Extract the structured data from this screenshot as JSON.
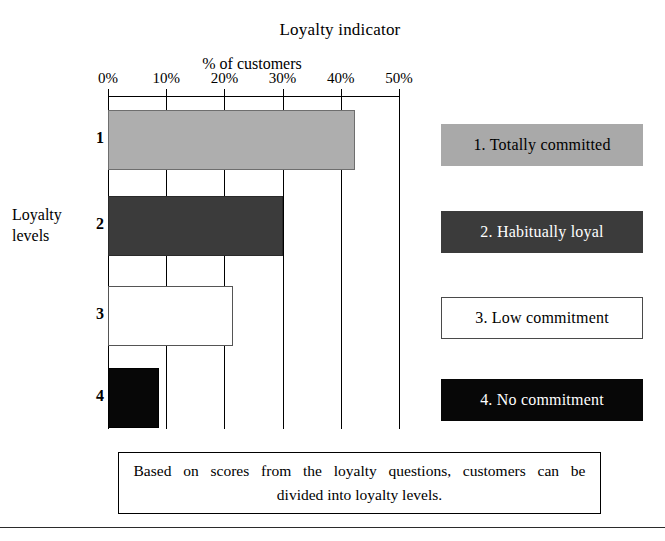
{
  "chart_data": {
    "type": "bar",
    "orientation": "horizontal",
    "title": "Loyalty indicator",
    "xlabel": "% of customers",
    "ylabel": "Loyalty levels",
    "categories": [
      "1",
      "2",
      "3",
      "4"
    ],
    "values": [
      42.5,
      30.0,
      21.5,
      8.8
    ],
    "xlim": [
      0,
      50
    ],
    "xticks": [
      0,
      10,
      20,
      30,
      40,
      50
    ],
    "xtick_labels": [
      "0%",
      "10%",
      "20%",
      "30%",
      "40%",
      "50%"
    ],
    "grid": true,
    "axis_position": "top",
    "legend_position": "right",
    "series": [
      {
        "name": "Totally committed",
        "category": "1",
        "value": 42.5,
        "fill": "#aeaeae",
        "text_color": "#000000"
      },
      {
        "name": "Habitually loyal",
        "category": "2",
        "value": 30.0,
        "fill": "#3b3b3b",
        "text_color": "#ffffff"
      },
      {
        "name": "Low commitment",
        "category": "3",
        "value": 21.5,
        "fill": "#ffffff",
        "text_color": "#000000"
      },
      {
        "name": "No commitment",
        "category": "4",
        "value": 8.8,
        "fill": "#070707",
        "text_color": "#ffffff"
      }
    ],
    "annotations": [
      "Based on scores from the loyalty questions, customers can be",
      "divided into loyalty levels."
    ]
  },
  "chart": {
    "title": "Loyalty indicator",
    "axis_title": "% of customers",
    "y_axis_label_line1": "Loyalty",
    "y_axis_label_line2": "levels",
    "tick_labels": [
      "0%",
      "10%",
      "20%",
      "30%",
      "40%",
      "50%"
    ],
    "category_labels": [
      "1",
      "2",
      "3",
      "4"
    ]
  },
  "legend": {
    "items": [
      {
        "label": "1.  Totally committed"
      },
      {
        "label": "2.  Habitually loyal"
      },
      {
        "label": "3.  Low commitment"
      },
      {
        "label": "4.  No commitment"
      }
    ]
  },
  "caption": {
    "line1": "Based on scores from the loyalty questions, customers can be",
    "line2": "divided into loyalty levels."
  }
}
